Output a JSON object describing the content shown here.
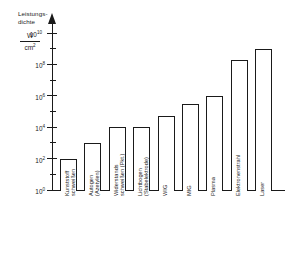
{
  "chart_data": {
    "type": "bar",
    "title": "",
    "ylabel": "Leistungsdichte",
    "yunit_numerator": "W",
    "yunit_denominator": "cm",
    "yunit_denominator_exp": "2",
    "xlabel": "",
    "yscale": "log",
    "ylim": [
      1,
      10000000000
    ],
    "grid": false,
    "legend": null,
    "ytick_labels": [
      {
        "base": "10",
        "exp": "0",
        "value": 1
      },
      {
        "base": "10",
        "exp": "2",
        "value": 100
      },
      {
        "base": "10",
        "exp": "4",
        "value": 10000
      },
      {
        "base": "10",
        "exp": "6",
        "value": 1000000
      },
      {
        "base": "10",
        "exp": "8",
        "value": 100000000
      },
      {
        "base": "10",
        "exp": "10",
        "value": 10000000000
      }
    ],
    "categories": [
      "Kunststoff-\nschweißen",
      "Autogen\n(Azetylen)",
      "Widerstands-\nschweißen (Pkt.)",
      "Lichtbogen\n(Stabelektrode)",
      "WIG",
      "MIG",
      "Plasma",
      "Elektronenstrahl",
      "Laser"
    ],
    "category_lines": [
      [
        "Kunststoff",
        "schweißen"
      ],
      [
        "Autogen",
        "(Azetylen)"
      ],
      [
        "Widerstands",
        "schweißen (Pkt.)"
      ],
      [
        "Lichtbogen",
        "(Stabelektrode)"
      ],
      [
        "WIG",
        ""
      ],
      [
        "MIG",
        ""
      ],
      [
        "Plasma",
        ""
      ],
      [
        "Elektronenstrahl",
        ""
      ],
      [
        "Laser",
        ""
      ]
    ],
    "values": [
      100,
      1000,
      10000,
      10000,
      50000,
      300000,
      1000000,
      200000000,
      1000000000
    ],
    "value_labels": [
      "10^2",
      "10^3",
      "10^4",
      "10^4",
      "5x10^4",
      "3x10^5",
      "10^6",
      "2x10^8",
      "10^9"
    ]
  },
  "colors": {
    "axis": "#1a1a1a",
    "bar_fill": "#ffffff",
    "bar_stroke": "#1a1a1a",
    "background": "#ffffff"
  }
}
